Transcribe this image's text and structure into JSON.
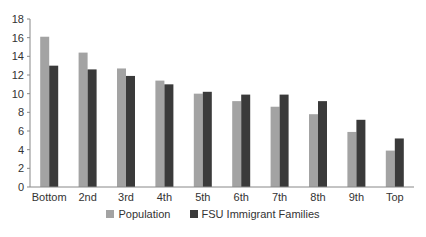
{
  "chart_data": {
    "type": "bar",
    "title": "",
    "xlabel": "",
    "ylabel": "",
    "ylim": [
      0,
      18
    ],
    "yticks": [
      0,
      2,
      4,
      6,
      8,
      10,
      12,
      14,
      16,
      18
    ],
    "grid": false,
    "legend_position": "bottom",
    "categories": [
      "Bottom",
      "2nd",
      "3rd",
      "4th",
      "5th",
      "6th",
      "7th",
      "8th",
      "9th",
      "Top"
    ],
    "series": [
      {
        "name": "Population",
        "color": "#a3a3a3",
        "values": [
          16.1,
          14.4,
          12.7,
          11.4,
          10.0,
          9.2,
          8.6,
          7.8,
          5.9,
          3.9
        ]
      },
      {
        "name": "FSU Immigrant Families",
        "color": "#3a3a3a",
        "values": [
          13.0,
          12.6,
          11.9,
          11.0,
          10.2,
          9.9,
          9.9,
          9.2,
          7.2,
          5.2
        ]
      }
    ]
  },
  "legend": {
    "items": [
      {
        "label": "Population",
        "color": "#a3a3a3"
      },
      {
        "label": "FSU Immigrant Families",
        "color": "#3a3a3a"
      }
    ]
  }
}
